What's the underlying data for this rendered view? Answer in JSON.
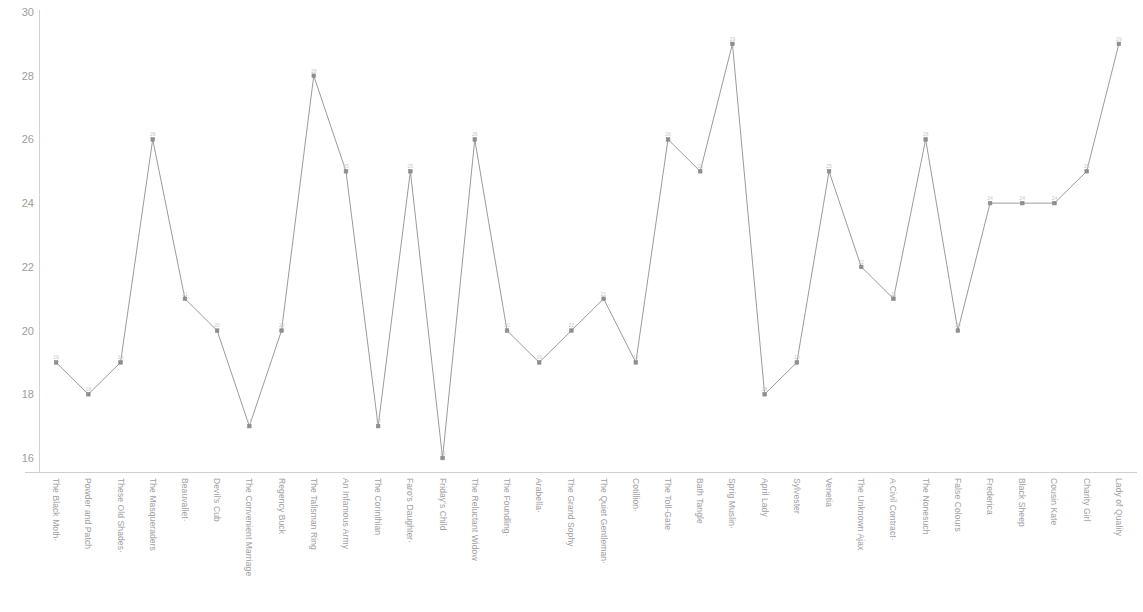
{
  "chart_data": {
    "type": "line",
    "title": "",
    "subtitle": "",
    "xlabel": "",
    "ylabel": "",
    "ylim": [
      16,
      30
    ],
    "ytick_labels": [
      "30",
      "28",
      "26",
      "24",
      "22",
      "20",
      "18",
      "16"
    ],
    "yticks": [
      30,
      28,
      26,
      24,
      22,
      20,
      18,
      16
    ],
    "grid": false,
    "legend": "none",
    "line_color": "#9b9b9b",
    "marker_color": "#8d8d8d",
    "axis_color": "#d2d2d2",
    "label_color": "#9d9d9d",
    "categories": [
      "The Black Moth·",
      "Powder and Patch",
      "These Old Shades·",
      "The Masqueraders",
      "Beauvallet·",
      "Devil's Cub",
      "The Convenient Marriage",
      "Regency Buck",
      "The Talisman Ring",
      "An Infamous Army",
      "The Corinthian",
      "Faro's Daughter·",
      "Friday's Child",
      "The Reluctant Widow",
      "The Foundling·",
      "Arabella·",
      "The Grand Sophy",
      "The Quiet Gentleman·",
      "Cotillion·",
      "The Toll-Gate",
      "Bath Tangle",
      "Sprig Muslin·",
      "April Lady",
      "Sylvester",
      "Venetia",
      "The Unknown Ajax",
      "A Civil Contract·",
      "The Nonesuch",
      "False Colours",
      "Frederica",
      "Black Sheep",
      "Cousin Kate",
      "Charity Girl",
      "Lady of Quality"
    ],
    "values": [
      19,
      18,
      19,
      26,
      21,
      20,
      17,
      20,
      28,
      25,
      17,
      25,
      16,
      26,
      20,
      19,
      20,
      21,
      19,
      26,
      25,
      29,
      18,
      19,
      25,
      22,
      21,
      26,
      20,
      24,
      24,
      24,
      25,
      29
    ],
    "point_labels": [
      "19",
      "18",
      "19",
      "26",
      "21",
      "20",
      "17",
      "20",
      "28",
      "25",
      "17",
      "25",
      "16",
      "26",
      "20",
      "19",
      "20",
      "21",
      "19",
      "26",
      "25",
      "29",
      "18",
      "19",
      "25",
      "22",
      "21",
      "26",
      "20",
      "24",
      "24",
      "24",
      "25",
      "29"
    ]
  }
}
